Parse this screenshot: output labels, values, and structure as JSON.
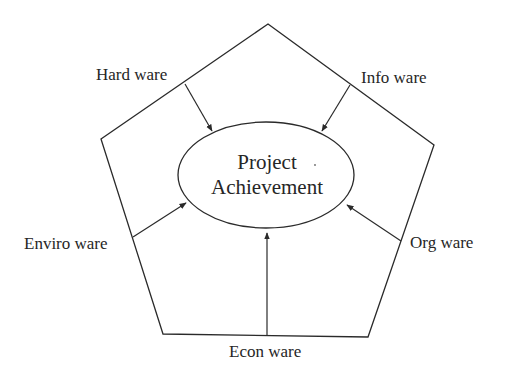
{
  "diagram": {
    "type": "pentagon-with-central-ellipse",
    "center": {
      "line1": "Project",
      "line2": "Achievement"
    },
    "factors": [
      {
        "id": "hardware",
        "label": "Hard ware",
        "position": "upper-left"
      },
      {
        "id": "infoware",
        "label": "Info ware",
        "position": "upper-right"
      },
      {
        "id": "envirowware",
        "label": "Enviro ware",
        "position": "lower-left"
      },
      {
        "id": "orgware",
        "label": "Org ware",
        "position": "lower-right"
      },
      {
        "id": "econware",
        "label": "Econ ware",
        "position": "bottom"
      }
    ],
    "relationship": "each factor points with an arrow toward the central Project Achievement",
    "colors": {
      "line": "#2a2a2a",
      "text": "#262626",
      "background": "#ffffff"
    }
  }
}
